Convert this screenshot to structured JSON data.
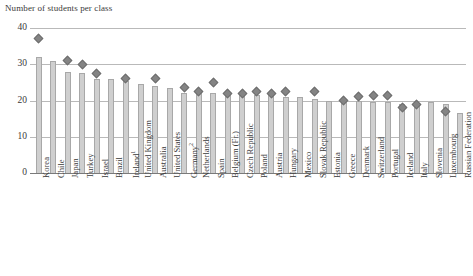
{
  "chart_data": {
    "type": "bar",
    "title": "Number of students per class",
    "xlabel": "",
    "ylabel": "Number of students per class",
    "ylim": [
      0,
      40
    ],
    "yticks": [
      0,
      10,
      20,
      30,
      40
    ],
    "grid": true,
    "legend": "none",
    "categories": [
      "Korea",
      "Chile",
      "Japan",
      "Turkey",
      "Israel",
      "Brazil",
      "Ireland¹",
      "United Kingdom",
      "Australia",
      "United States",
      "Germany²",
      "Netherlands",
      "Spain",
      "Belgium (Fr.)",
      "Czech Republic",
      "Poland",
      "Austria",
      "Hungary",
      "Mexico",
      "Slovak Republic",
      "Estonia",
      "Greece",
      "Denmark",
      "Switzerland",
      "Portugal",
      "Iceland",
      "Italy",
      "Slovenia",
      "Luxembourg",
      "Russian Federation"
    ],
    "series": [
      {
        "name": "bars",
        "kind": "bar",
        "values": [
          32.0,
          31.0,
          28.0,
          27.5,
          26.0,
          26.0,
          25.5,
          24.5,
          24.0,
          23.5,
          22.0,
          22.0,
          22.0,
          21.5,
          21.5,
          21.5,
          21.5,
          21.0,
          21.0,
          20.5,
          20.0,
          20.0,
          20.0,
          19.5,
          19.5,
          19.0,
          19.0,
          19.5,
          19.0,
          16.5
        ]
      },
      {
        "name": "markers",
        "kind": "scatter-diamond",
        "values": [
          37.0,
          null,
          31.0,
          30.0,
          27.5,
          null,
          26.0,
          null,
          26.0,
          null,
          23.5,
          22.5,
          25.0,
          22.0,
          22.0,
          22.5,
          22.0,
          22.5,
          null,
          22.5,
          null,
          20.0,
          21.0,
          21.5,
          21.5,
          18.0,
          19.0,
          null,
          17.0,
          null
        ]
      }
    ]
  }
}
